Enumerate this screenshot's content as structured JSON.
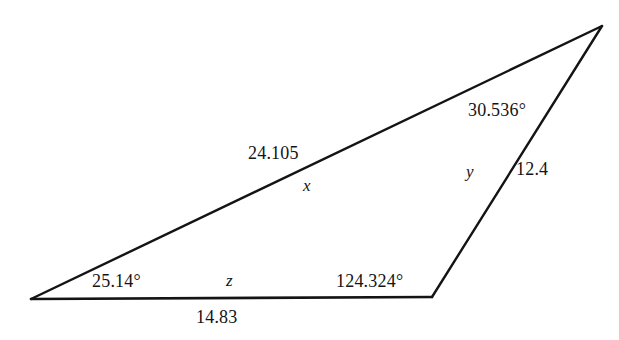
{
  "figure": {
    "type": "triangle-diagram",
    "background_color": "#ffffff",
    "stroke_color": "#141414",
    "stroke_width": 2,
    "vertices": {
      "left": {
        "x": 31,
        "y": 299
      },
      "bottom_right": {
        "x": 432,
        "y": 297
      },
      "apex": {
        "x": 602,
        "y": 26
      }
    },
    "sides": [
      {
        "name": "long-diagonal",
        "from": "left",
        "to": "apex",
        "value_label": "24.105",
        "variable_label": "x"
      },
      {
        "name": "right-side",
        "from": "bottom_right",
        "to": "apex",
        "value_label": "12.4",
        "variable_label": "y"
      },
      {
        "name": "base",
        "from": "left",
        "to": "bottom_right",
        "value_label": "14.83",
        "variable_label": "z"
      }
    ],
    "angles": [
      {
        "name": "left-vertex-angle",
        "label": "25.14°"
      },
      {
        "name": "bottom-right-vertex-angle",
        "label": "124.324°"
      },
      {
        "name": "apex-angle",
        "label": "30.536°"
      }
    ]
  },
  "labels": {
    "side_x_value": "24.105",
    "side_x_var": "x",
    "side_y_value": "12.4",
    "side_y_var": "y",
    "side_z_value": "14.83",
    "side_z_var": "z",
    "angle_left": "25.14°",
    "angle_right": "124.324°",
    "angle_apex": "30.536°"
  }
}
